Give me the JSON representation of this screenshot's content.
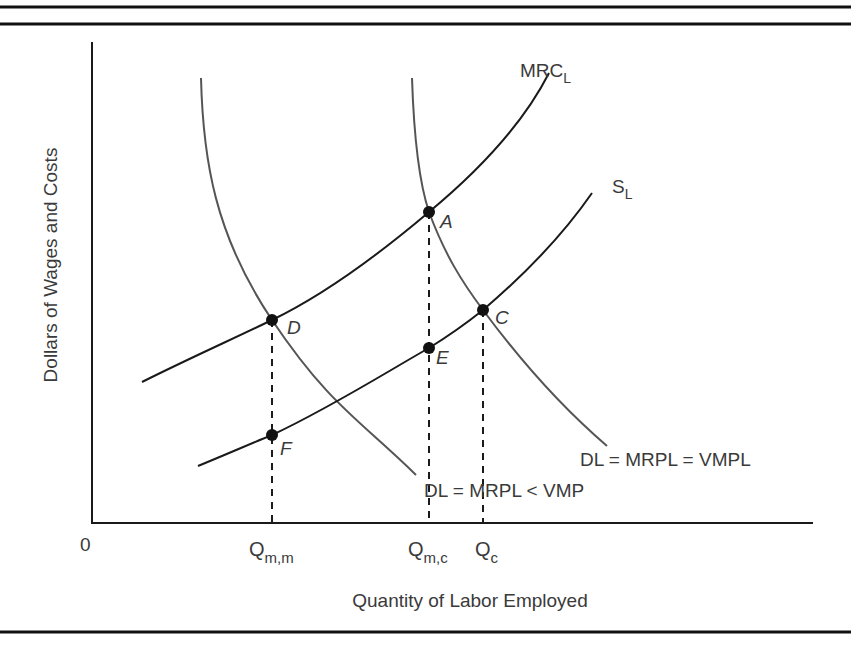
{
  "diagram": {
    "type": "monopsony labor market diagram",
    "axes": {
      "y_label": "Dollars of Wages and Costs",
      "x_label": "Quantity of Labor Employed",
      "origin_label": "0"
    },
    "curves": {
      "mrc": {
        "label_main": "MRC",
        "label_sub": "L"
      },
      "supply": {
        "label_main": "S",
        "label_sub": "L"
      },
      "demand_competitive": {
        "label": "DL = MRPL = VMPL"
      },
      "demand_monopsony": {
        "label": "DL = MRPL < VMP"
      }
    },
    "points": [
      {
        "id": "A",
        "label": "A"
      },
      {
        "id": "C",
        "label": "C"
      },
      {
        "id": "D",
        "label": "D"
      },
      {
        "id": "E",
        "label": "E"
      },
      {
        "id": "F",
        "label": "F"
      }
    ],
    "x_ticks": [
      {
        "main": "Q",
        "sub": "m,m"
      },
      {
        "main": "Q",
        "sub": "m,c"
      },
      {
        "main": "Q",
        "sub": "c"
      }
    ],
    "colors": {
      "axis": "#1a1a1a",
      "curve_dark": "#1a1a1a",
      "curve_gray": "#555555",
      "text": "#3a3a3a",
      "rule": "#111111"
    }
  }
}
